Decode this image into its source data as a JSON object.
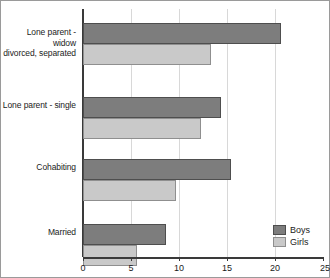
{
  "chart_data": {
    "type": "bar",
    "orientation": "horizontal",
    "title": "",
    "xlabel": "",
    "ylabel": "",
    "categories": [
      "Married",
      "Cohabiting",
      "Lone parent - single",
      "Lone parent - widow\ndivorced, separated"
    ],
    "series": [
      {
        "name": "Boys",
        "values": [
          8.6,
          15.4,
          14.4,
          20.6
        ],
        "color": "#7d7d7d"
      },
      {
        "name": "Girls",
        "values": [
          5.6,
          9.7,
          12.3,
          13.3
        ],
        "color": "#c9c9c9"
      }
    ],
    "xlim": [
      0,
      25
    ],
    "xticks": [
      0,
      5,
      10,
      15,
      20,
      25
    ],
    "xticklabels": [
      "0",
      "5",
      "10",
      "15",
      "20",
      "25"
    ],
    "grid": "vertical",
    "legend_position": "bottom-right",
    "legend_entries": [
      "Boys",
      "Girls"
    ]
  },
  "labels": {
    "cat_married": "Married",
    "cat_cohabiting": "Cohabiting",
    "cat_lone_single": "Lone parent - single",
    "cat_lone_widow_line1": "Lone parent - widow",
    "cat_lone_widow_line2": "divorced, separated"
  },
  "legend": {
    "boys": "Boys",
    "girls": "Girls"
  },
  "axis": {
    "t0": "0",
    "t5": "5",
    "t10": "10",
    "t15": "15",
    "t20": "20",
    "t25": "25"
  }
}
